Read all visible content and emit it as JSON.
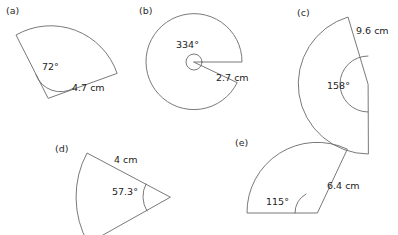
{
  "figure": {
    "stroke_color": "#6a6a6a",
    "text_color": "#1d1d1d",
    "background": "#ffffff",
    "width": 398,
    "height": 235
  },
  "sectors": [
    {
      "id": "a",
      "panel_label": "(a)",
      "angle_label": "72°",
      "angle_value": 72,
      "radius_label": "4.7 cm",
      "radius_value": 4.7,
      "radius_unit": "cm"
    },
    {
      "id": "b",
      "panel_label": "(b)",
      "angle_label": "334°",
      "angle_value": 334,
      "radius_label": "2.7 cm",
      "radius_value": 2.7,
      "radius_unit": "cm"
    },
    {
      "id": "c",
      "panel_label": "(c)",
      "angle_label": "158°",
      "angle_value": 158,
      "radius_label": "9.6 cm",
      "radius_value": 9.6,
      "radius_unit": "cm"
    },
    {
      "id": "d",
      "panel_label": "(d)",
      "angle_label": "57.3°",
      "angle_value": 57.3,
      "radius_label": "4 cm",
      "radius_value": 4,
      "radius_unit": "cm"
    },
    {
      "id": "e",
      "panel_label": "(e)",
      "angle_label": "115°",
      "angle_value": 115,
      "radius_label": "6.4 cm",
      "radius_value": 6.4,
      "radius_unit": "cm"
    }
  ]
}
